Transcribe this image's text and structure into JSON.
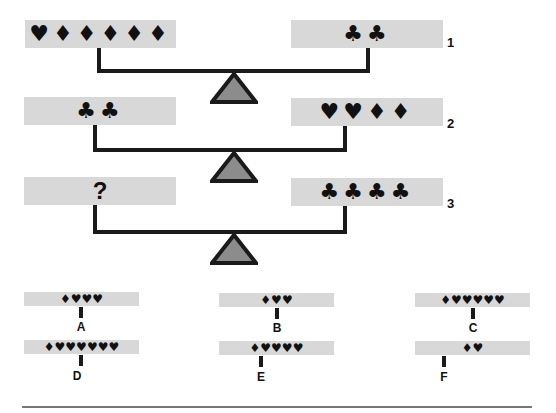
{
  "scales": [
    {
      "row": "1",
      "left": "♥♦♦♦♦♦",
      "right": "♣♣"
    },
    {
      "row": "2",
      "left": "♣♣",
      "right": "♥♥♦♦"
    },
    {
      "row": "3",
      "left": "?",
      "right": "♣♣♣♣"
    }
  ],
  "options": [
    {
      "label": "A",
      "symbols": "♦♥♥♥"
    },
    {
      "label": "B",
      "symbols": "♦♥♥"
    },
    {
      "label": "C",
      "symbols": "♦♥♥♥♥♥"
    },
    {
      "label": "D",
      "symbols": "♦♥♥♥♥♥♥"
    },
    {
      "label": "E",
      "symbols": "♦♥♥♥♥"
    },
    {
      "label": "F",
      "symbols": "♦♥"
    }
  ],
  "colors": {
    "pan": "#d8d8d8",
    "beam": "#1a1a1a",
    "fulcrum_fill": "#8c8c8c"
  }
}
